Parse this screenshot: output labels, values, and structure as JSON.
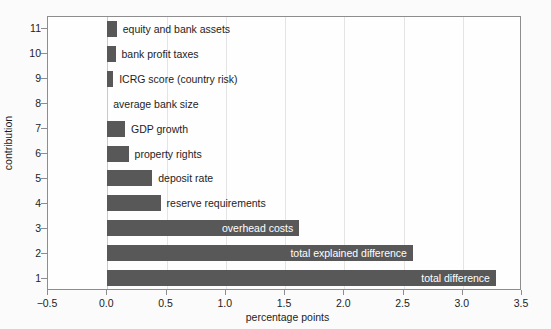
{
  "chart_data": {
    "type": "bar",
    "orientation": "horizontal",
    "title": "",
    "xlabel": "percentage points",
    "ylabel": "contribution",
    "xlim": [
      -0.5,
      3.5
    ],
    "xticks": [
      "-0.5",
      "0.0",
      "0.5",
      "1.0",
      "1.5",
      "2.0",
      "2.5",
      "3.0",
      "3.5"
    ],
    "xtick_values": [
      -0.5,
      0.0,
      0.5,
      1.0,
      1.5,
      2.0,
      2.5,
      3.0,
      3.5
    ],
    "yticks": [
      "1",
      "2",
      "3",
      "4",
      "5",
      "6",
      "7",
      "8",
      "9",
      "10",
      "11"
    ],
    "grid": "vertical",
    "legend": "none",
    "bar_color": "#585858",
    "categories": [
      "total difference",
      "total explained difference",
      "overhead costs",
      "reserve requirements",
      "deposit rate",
      "property rights",
      "GDP growth",
      "average bank size",
      "ICRG score (country risk)",
      "bank profit taxes",
      "equity and bank assets"
    ],
    "values": [
      3.28,
      2.58,
      1.62,
      0.45,
      0.38,
      0.18,
      0.15,
      0.0,
      0.05,
      0.07,
      0.08
    ],
    "bars": [
      {
        "tick": "1",
        "label": "total difference",
        "value": 3.28,
        "label_position": "inside"
      },
      {
        "tick": "2",
        "label": "total explained difference",
        "value": 2.58,
        "label_position": "inside"
      },
      {
        "tick": "3",
        "label": "overhead costs",
        "value": 1.62,
        "label_position": "inside"
      },
      {
        "tick": "4",
        "label": "reserve requirements",
        "value": 0.45,
        "label_position": "outside"
      },
      {
        "tick": "5",
        "label": "deposit rate",
        "value": 0.38,
        "label_position": "outside"
      },
      {
        "tick": "6",
        "label": "property rights",
        "value": 0.18,
        "label_position": "outside"
      },
      {
        "tick": "7",
        "label": "GDP growth",
        "value": 0.15,
        "label_position": "outside"
      },
      {
        "tick": "8",
        "label": "average bank size",
        "value": 0.0,
        "label_position": "outside"
      },
      {
        "tick": "9",
        "label": "ICRG score (country risk)",
        "value": 0.05,
        "label_position": "outside"
      },
      {
        "tick": "10",
        "label": "bank profit taxes",
        "value": 0.07,
        "label_position": "outside"
      },
      {
        "tick": "11",
        "label": "equity and bank assets",
        "value": 0.08,
        "label_position": "outside"
      }
    ]
  }
}
